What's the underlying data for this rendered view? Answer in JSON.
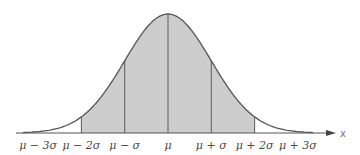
{
  "figure": {
    "axis_variable": "x",
    "colors": {
      "curve": "#555555",
      "fill": "#cccccc",
      "axis": "#555555",
      "background": "#ffffff"
    },
    "shaded_region": {
      "from": "μ − 2σ",
      "to": "μ + 2σ"
    },
    "tick_labels": [
      "μ − 3σ",
      "μ − 2σ",
      "μ − σ",
      "μ",
      "μ + σ",
      "μ + 2σ",
      "μ + 3σ"
    ],
    "divider_lines_at": [
      "μ − 2σ",
      "μ − σ",
      "μ",
      "μ + σ",
      "μ + 2σ"
    ]
  },
  "chart_data": {
    "type": "area",
    "title": "",
    "xlabel": "x",
    "ylabel": "",
    "x": [
      -3,
      -2,
      -1,
      0,
      1,
      2,
      3
    ],
    "categories": [
      "μ − 3σ",
      "μ − 2σ",
      "μ − σ",
      "μ",
      "μ + σ",
      "μ + 2σ",
      "μ + 3σ"
    ],
    "series": [
      {
        "name": "normal density",
        "values": [
          0.0111,
          0.1353,
          0.6065,
          1.0,
          0.6065,
          0.1353,
          0.0111
        ]
      }
    ],
    "shaded_range": [
      -2,
      2
    ],
    "grid": false
  }
}
